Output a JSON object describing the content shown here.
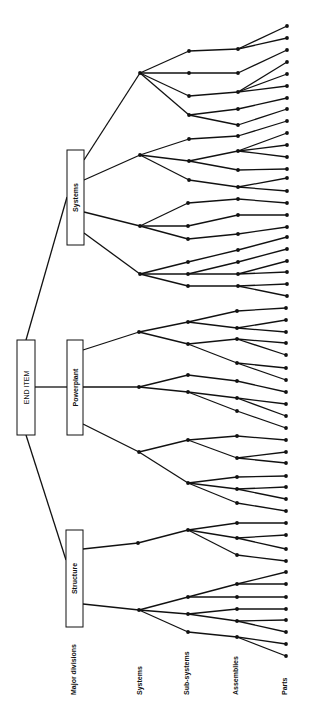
{
  "diagram": {
    "root": {
      "label": "END ITEM",
      "x": 17,
      "y": 340,
      "w": 18,
      "h": 95
    },
    "major_divisions": [
      {
        "label": "Systems",
        "x": 67,
        "y": 150,
        "w": 17,
        "h": 95
      },
      {
        "label": "Powerplant",
        "x": 67,
        "y": 340,
        "w": 16,
        "h": 95
      },
      {
        "label": "Structure",
        "x": 66,
        "y": 530,
        "w": 17,
        "h": 97
      }
    ],
    "level_labels": [
      {
        "label": "Major divisions",
        "x": 76,
        "y": 695
      },
      {
        "label": "Systems",
        "x": 142,
        "y": 695
      },
      {
        "label": "Sub-systems",
        "x": 189,
        "y": 695
      },
      {
        "label": "Assemblies",
        "x": 238,
        "y": 695
      },
      {
        "label": "Parts",
        "x": 287,
        "y": 695
      }
    ],
    "colors": {
      "line": "#111111",
      "background": "#ffffff"
    },
    "edges": [
      [
        26,
        340,
        67,
        197
      ],
      [
        26,
        435,
        66,
        560
      ],
      [
        35,
        387,
        67,
        387
      ],
      [
        84,
        160,
        140,
        73
      ],
      [
        84,
        180,
        140,
        155
      ],
      [
        84,
        212,
        140,
        226
      ],
      [
        84,
        233,
        140,
        274
      ],
      [
        83,
        350,
        139,
        332
      ],
      [
        83,
        387,
        139,
        387
      ],
      [
        83,
        424,
        139,
        452
      ],
      [
        83,
        549,
        138,
        543
      ],
      [
        83,
        604,
        139,
        610
      ],
      [
        140,
        73,
        189,
        51
      ],
      [
        140,
        73,
        189,
        73
      ],
      [
        140,
        73,
        189,
        96
      ],
      [
        140,
        73,
        189,
        115
      ],
      [
        189,
        51,
        238,
        49
      ],
      [
        238,
        49,
        287,
        26
      ],
      [
        238,
        49,
        287,
        38
      ],
      [
        189,
        73,
        238,
        73
      ],
      [
        238,
        73,
        287,
        50
      ],
      [
        189,
        96,
        238,
        92
      ],
      [
        238,
        92,
        287,
        62
      ],
      [
        238,
        92,
        287,
        74
      ],
      [
        238,
        92,
        287,
        86
      ],
      [
        189,
        115,
        238,
        109
      ],
      [
        238,
        109,
        287,
        98
      ],
      [
        189,
        115,
        238,
        125
      ],
      [
        238,
        125,
        287,
        109
      ],
      [
        140,
        155,
        189,
        139
      ],
      [
        140,
        155,
        189,
        161
      ],
      [
        140,
        155,
        189,
        180
      ],
      [
        189,
        139,
        238,
        136
      ],
      [
        238,
        136,
        287,
        121
      ],
      [
        189,
        161,
        238,
        151
      ],
      [
        238,
        151,
        287,
        133
      ],
      [
        238,
        151,
        287,
        145
      ],
      [
        238,
        151,
        287,
        157
      ],
      [
        189,
        161,
        238,
        170
      ],
      [
        238,
        170,
        287,
        169
      ],
      [
        189,
        180,
        238,
        187
      ],
      [
        238,
        187,
        287,
        178
      ],
      [
        238,
        187,
        287,
        191
      ],
      [
        140,
        226,
        188,
        203
      ],
      [
        140,
        226,
        188,
        226
      ],
      [
        140,
        226,
        188,
        239
      ],
      [
        188,
        203,
        238,
        199
      ],
      [
        238,
        199,
        287,
        203
      ],
      [
        188,
        226,
        238,
        215
      ],
      [
        238,
        215,
        287,
        215
      ],
      [
        188,
        239,
        238,
        234
      ],
      [
        238,
        234,
        287,
        227
      ],
      [
        140,
        274,
        188,
        262
      ],
      [
        140,
        274,
        188,
        274
      ],
      [
        140,
        274,
        188,
        286
      ],
      [
        188,
        262,
        238,
        250
      ],
      [
        238,
        250,
        287,
        237
      ],
      [
        188,
        274,
        238,
        262
      ],
      [
        238,
        262,
        287,
        249
      ],
      [
        188,
        274,
        238,
        274
      ],
      [
        238,
        274,
        287,
        261
      ],
      [
        238,
        274,
        287,
        272
      ],
      [
        188,
        286,
        238,
        286
      ],
      [
        238,
        286,
        287,
        284
      ],
      [
        238,
        286,
        287,
        296
      ],
      [
        139,
        332,
        188,
        322
      ],
      [
        139,
        332,
        188,
        344
      ],
      [
        188,
        322,
        237,
        311
      ],
      [
        237,
        311,
        286,
        308
      ],
      [
        188,
        322,
        237,
        328
      ],
      [
        237,
        328,
        286,
        320
      ],
      [
        237,
        328,
        286,
        332
      ],
      [
        188,
        344,
        237,
        339
      ],
      [
        237,
        339,
        286,
        343
      ],
      [
        237,
        339,
        286,
        355
      ],
      [
        188,
        344,
        237,
        363
      ],
      [
        237,
        363,
        286,
        368
      ],
      [
        237,
        363,
        286,
        380
      ],
      [
        139,
        387,
        188,
        375
      ],
      [
        139,
        387,
        188,
        392
      ],
      [
        188,
        375,
        237,
        381
      ],
      [
        237,
        381,
        286,
        392
      ],
      [
        188,
        392,
        237,
        398
      ],
      [
        237,
        398,
        286,
        404
      ],
      [
        237,
        398,
        286,
        416
      ],
      [
        188,
        392,
        237,
        411
      ],
      [
        237,
        411,
        286,
        428
      ],
      [
        139,
        452,
        188,
        440
      ],
      [
        139,
        452,
        188,
        483
      ],
      [
        188,
        440,
        237,
        436
      ],
      [
        237,
        436,
        286,
        440
      ],
      [
        188,
        440,
        237,
        458
      ],
      [
        237,
        458,
        286,
        452
      ],
      [
        237,
        458,
        286,
        463
      ],
      [
        188,
        483,
        237,
        477
      ],
      [
        237,
        477,
        286,
        476
      ],
      [
        188,
        483,
        237,
        489
      ],
      [
        237,
        489,
        286,
        487
      ],
      [
        237,
        489,
        286,
        499
      ],
      [
        188,
        483,
        237,
        503
      ],
      [
        237,
        503,
        286,
        511
      ],
      [
        138,
        543,
        188,
        530
      ],
      [
        188,
        530,
        237,
        523
      ],
      [
        237,
        523,
        286,
        523
      ],
      [
        188,
        530,
        237,
        538
      ],
      [
        237,
        538,
        286,
        535
      ],
      [
        237,
        538,
        286,
        549
      ],
      [
        188,
        530,
        237,
        555
      ],
      [
        237,
        555,
        286,
        561
      ],
      [
        139,
        610,
        188,
        597
      ],
      [
        139,
        610,
        188,
        614
      ],
      [
        139,
        610,
        188,
        632
      ],
      [
        188,
        597,
        237,
        584
      ],
      [
        237,
        584,
        286,
        572
      ],
      [
        237,
        584,
        286,
        584
      ],
      [
        188,
        597,
        237,
        597
      ],
      [
        237,
        597,
        286,
        597
      ],
      [
        188,
        614,
        237,
        609
      ],
      [
        237,
        609,
        286,
        609
      ],
      [
        188,
        614,
        237,
        621
      ],
      [
        237,
        621,
        286,
        620
      ],
      [
        237,
        621,
        286,
        632
      ],
      [
        188,
        632,
        237,
        637
      ],
      [
        237,
        637,
        286,
        644
      ],
      [
        237,
        637,
        286,
        656
      ]
    ]
  }
}
